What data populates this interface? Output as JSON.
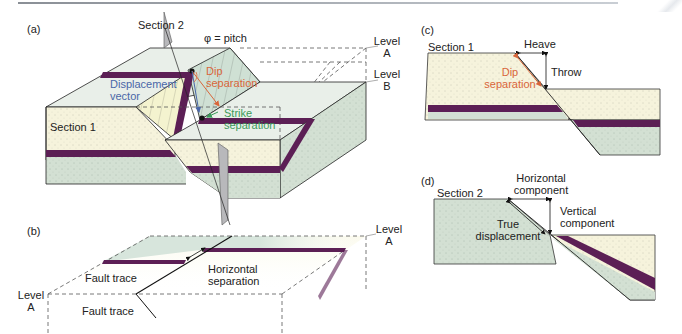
{
  "figure": {
    "colors": {
      "sandstone": "#f6f3dc",
      "greenstone": "#d3e0d3",
      "marker_bed": "#5c1f55",
      "fault_plane": "#cfe0d4",
      "section_plane": "#b8b8bb",
      "dip_separation": "#d9663a",
      "displacement_vector": "#4a67a8",
      "strike_separation": "#3a9a5a"
    },
    "panel_a": {
      "tag": "(a)",
      "section2": "Section 2",
      "pitch": "φ = pitch",
      "phi": "φ",
      "level_a": [
        "Level",
        "A"
      ],
      "level_b": [
        "Level",
        "B"
      ],
      "dip_separation": [
        "Dip",
        "separation"
      ],
      "displacement_vector": [
        "Displacement",
        "vector"
      ],
      "strike_separation": [
        "Strike",
        "separation"
      ],
      "section1": "Section 1"
    },
    "panel_b": {
      "tag": "(b)",
      "level_a_right": [
        "Level",
        "A"
      ],
      "level_a_left": [
        "Level",
        "A"
      ],
      "horizontal_separation": [
        "Horizontal",
        "separation"
      ],
      "fault_trace_upper": "Fault trace",
      "fault_trace_lower": "Fault trace"
    },
    "panel_c": {
      "tag": "(c)",
      "section1": "Section 1",
      "heave": "Heave",
      "throw": "Throw",
      "dip_separation": [
        "Dip",
        "separation"
      ]
    },
    "panel_d": {
      "tag": "(d)",
      "section2": "Section 2",
      "horizontal_component": [
        "Horizontal",
        "component"
      ],
      "vertical_component": [
        "Vertical",
        "component"
      ],
      "true_displacement": [
        "True",
        "displacement"
      ]
    }
  }
}
